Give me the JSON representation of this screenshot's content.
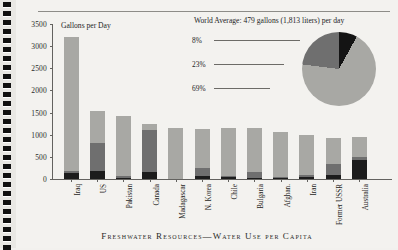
{
  "caption": "Freshwater Resources—Water Use per Capita",
  "chart_data": {
    "type": "bar",
    "title": "Gallons per Day",
    "xlabel": "",
    "ylabel": "Gallons per Day",
    "ylim": [
      0,
      3500
    ],
    "yticks": [
      0,
      500,
      1000,
      1500,
      2000,
      2500,
      3000,
      3500
    ],
    "grid": false,
    "legend_position": "none",
    "stacked": true,
    "categories": [
      "Iraq",
      "US",
      "Pakistan",
      "Canada",
      "Madagascar",
      "N. Korea",
      "Chile",
      "Bulgaria",
      "Afghan.",
      "Iran",
      "Former USSR",
      "Australia"
    ],
    "series": [
      {
        "name": "Domestic",
        "color": "#1c1c1c",
        "values": [
          130,
          190,
          30,
          160,
          0,
          60,
          40,
          30,
          20,
          40,
          90,
          430
        ]
      },
      {
        "name": "Industry",
        "color": "#6f6f6f",
        "values": [
          60,
          620,
          30,
          950,
          0,
          200,
          30,
          130,
          20,
          60,
          260,
          70
        ]
      },
      {
        "name": "Agriculture",
        "color": "#a8a8a4",
        "values": [
          3010,
          720,
          1370,
          130,
          1150,
          880,
          1080,
          1000,
          1020,
          900,
          580,
          440
        ]
      }
    ],
    "totals": [
      3200,
      1530,
      1430,
      1240,
      1150,
      1140,
      1150,
      1160,
      1060,
      1000,
      930,
      940
    ]
  },
  "pie": {
    "title": "World Average: 479 gallons (1,813 liters) per day",
    "type": "pie",
    "slices": [
      {
        "label": "8%",
        "value": 8,
        "color": "#141414"
      },
      {
        "label": "23%",
        "value": 23,
        "color": "#6f6f6f"
      },
      {
        "label": "69%",
        "value": 69,
        "color": "#a8a8a4"
      }
    ]
  }
}
